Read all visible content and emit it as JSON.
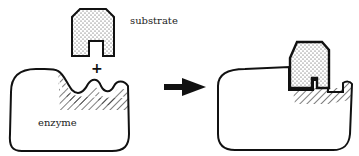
{
  "diagram": {
    "labels": {
      "substrate": "substrate",
      "enzyme": "enzyme",
      "plus": "+"
    },
    "stages": [
      {
        "name": "separate",
        "description": "Free substrate above enzyme with complementary active site"
      },
      {
        "name": "bound",
        "description": "Substrate fitted into enzyme active site"
      }
    ],
    "arrow": {
      "direction": "right",
      "meaning": "binding"
    },
    "colors": {
      "stroke": "#111111",
      "fill": "#ffffff",
      "stipple": "#333333"
    }
  }
}
